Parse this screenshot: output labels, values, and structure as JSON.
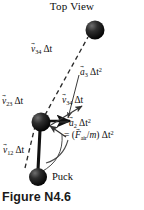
{
  "figure": {
    "title": "Top View",
    "caption": "Figure N4.6",
    "puck_label": "Puck",
    "background_color": "#ffffff",
    "ink_color": "#0d0d0d"
  },
  "labels": {
    "v34_top": {
      "vector": "v",
      "subscript": "34",
      "factor": "Δt",
      "exponent": ""
    },
    "a3": {
      "vector": "a",
      "subscript": "3",
      "factor": "Δt",
      "exponent": "2"
    },
    "v23": {
      "vector": "v",
      "subscript": "23",
      "factor": "Δt",
      "exponent": ""
    },
    "v34_mid": {
      "vector": "v",
      "subscript": "34",
      "factor": "Δt",
      "exponent": ""
    },
    "a2": {
      "vector": "a",
      "subscript": "2",
      "factor": "Δt",
      "exponent": "2"
    },
    "a2_equation": {
      "equals": "=",
      "open": "(",
      "vector": "F",
      "subscript": "air",
      "divide": "/",
      "mass": "m",
      "close": ")",
      "factor": "Δt",
      "exponent": "2"
    },
    "v12": {
      "vector": "v",
      "subscript": "12",
      "factor": "Δt",
      "exponent": ""
    }
  },
  "pucks": [
    {
      "name": "puck-position-4",
      "cx": 95,
      "cy": 30,
      "r": 9.5
    },
    {
      "name": "puck-position-3",
      "cx": 41,
      "cy": 122,
      "r": 9.5
    },
    {
      "name": "puck-position-2",
      "cx": 38,
      "cy": 177,
      "r": 9.0
    }
  ],
  "strokes": {
    "dashed_color": "#2a2a2a",
    "solid_color": "#111111",
    "arc_color": "#444444"
  }
}
